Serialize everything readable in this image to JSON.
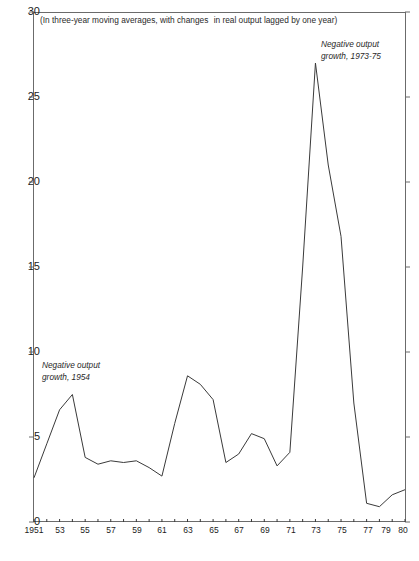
{
  "chart_data": {
    "type": "line",
    "title": "",
    "subtitle": "",
    "note": {
      "line1": "(In three-year moving averages, with changes",
      "line2": "in real output lagged by one year)"
    },
    "xlabel": "",
    "ylabel": "",
    "xlim": [
      1951,
      1980
    ],
    "ylim": [
      0,
      30
    ],
    "grid": false,
    "legend": "none",
    "ytick_labels": [
      "30",
      "25",
      "20",
      "15",
      "10",
      "5",
      "0"
    ],
    "ytick_values": [
      30,
      25,
      20,
      15,
      10,
      5,
      0
    ],
    "xtick_labels": [
      "1951",
      "53",
      "55",
      "57",
      "59",
      "61",
      "63",
      "65",
      "67",
      "69",
      "71",
      "73",
      "75",
      "77",
      "79",
      "80"
    ],
    "xtick_values": [
      1951,
      1953,
      1955,
      1957,
      1959,
      1961,
      1963,
      1965,
      1967,
      1969,
      1971,
      1973,
      1975,
      1977,
      1979,
      1980
    ],
    "x": [
      1951,
      1952,
      1953,
      1954,
      1955,
      1956,
      1957,
      1958,
      1959,
      1960,
      1961,
      1962,
      1963,
      1964,
      1965,
      1966,
      1967,
      1968,
      1969,
      1970,
      1971,
      1972,
      1973,
      1974,
      1975,
      1976,
      1977,
      1978,
      1979,
      1980
    ],
    "values": [
      2.6,
      4.6,
      6.6,
      7.5,
      3.8,
      3.4,
      3.6,
      3.5,
      3.6,
      3.2,
      2.7,
      5.8,
      8.6,
      8.1,
      7.2,
      3.5,
      4.0,
      5.2,
      4.9,
      3.3,
      4.1,
      15.0,
      27.0,
      21.0,
      16.8,
      7.0,
      1.1,
      0.9,
      1.6,
      1.9
    ],
    "series_name": "Producer price change",
    "line_color": "#3a3a3a",
    "annotations": [
      {
        "name": "negative-output-growth-1954",
        "line1": "Negative output",
        "line2": "growth, 1954",
        "x": 1954,
        "y": 9.5
      },
      {
        "name": "negative-output-growth-1973-75",
        "line1": "Negative output",
        "line2": "growth, 1973-75",
        "x": 1975,
        "y": 29.0
      }
    ],
    "axis_color": "#6b6b6b"
  }
}
